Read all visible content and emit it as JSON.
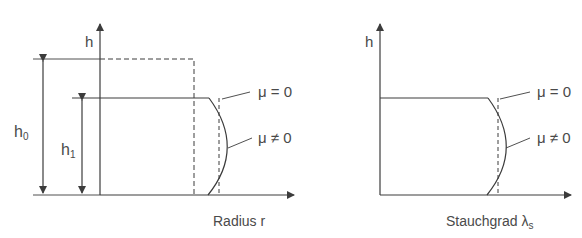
{
  "left_panel": {
    "y_axis_label": "h",
    "x_axis_label": "Radius r",
    "dim_h0": {
      "base": "h",
      "sub": "0"
    },
    "dim_h1": {
      "base": "h",
      "sub": "1"
    },
    "curve_labels": {
      "frictionless": "μ = 0",
      "friction": "μ ≠ 0"
    }
  },
  "right_panel": {
    "y_axis_label": "h",
    "x_axis_label": {
      "base": "Stauchgrad λ",
      "sub": "s"
    },
    "curve_labels": {
      "frictionless": "μ = 0",
      "friction": "μ ≠ 0"
    }
  },
  "colors": {
    "line": "#3c3c3c",
    "text": "#4a4a4a",
    "background": "#ffffff"
  }
}
